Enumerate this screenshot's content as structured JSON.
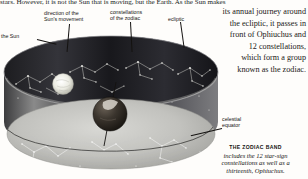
{
  "body_text": {
    "top_line": "stars. However, it is not the Sun that is moving, but the Earth. As the Sun makes"
  },
  "right_paragraph": {
    "lines": [
      "its annual journey around",
      "the ecliptic, it passes in",
      "front of Ophiuchus and",
      "12 constellations,",
      "which form a group",
      "known as the zodiac."
    ]
  },
  "labels": {
    "sun": "the Sun",
    "direction_line1": "direction of the",
    "direction_line2": "Sun's movement",
    "constellations_line1": "constellations",
    "constellations_line2": "of the zodiac",
    "ecliptic": "ecliptic",
    "equator_line1": "celestial",
    "equator_line2": "equator"
  },
  "caption": {
    "title": "THE ZODIAC BAND",
    "lines": [
      "includes the 12 star-sign",
      "constellations as well as a",
      "thirteenth, Ophiuchus."
    ]
  },
  "illustration": {
    "name": "zodiac-band-diagram",
    "band_color_dark": "#3a3a3c",
    "band_color_mid": "#6e6e70",
    "equator_plane_color": "#b9b9b6",
    "sun_color": "#efefe9",
    "earth_color": "#2a2724",
    "star_color": "#f2f2ee",
    "constellation_line_color": "#dcdcd6"
  }
}
